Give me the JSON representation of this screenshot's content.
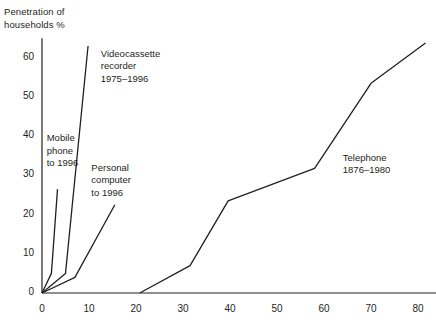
{
  "chart_data": {
    "type": "line",
    "title": "",
    "ylabel": "Penetration of\nhouseholds %",
    "xlabel": "",
    "xlim": [
      -1,
      84
    ],
    "ylim": [
      0,
      65
    ],
    "xticks": [
      0,
      10,
      20,
      30,
      40,
      50,
      60,
      70,
      80
    ],
    "xtick_labels": [
      "0",
      "10",
      "20",
      "30",
      "40",
      "50",
      "60",
      "70",
      "80"
    ],
    "yticks": [
      0,
      10,
      20,
      30,
      40,
      50,
      60
    ],
    "ytick_labels": [
      "0",
      "10",
      "20",
      "30",
      "40",
      "50",
      "60"
    ],
    "grid": false,
    "legend": "inline annotations",
    "series": [
      {
        "name": "Mobile phone to 1996",
        "label": "Mobile\nphone\nto 1996",
        "label_x": 1.0,
        "label_y": 39.5,
        "points": [
          [
            0,
            0
          ],
          [
            2.0,
            5.0
          ],
          [
            3.3,
            26.5
          ]
        ]
      },
      {
        "name": "Videocassette recorder 1975–1996",
        "label": "Videocassette\nrecorder\n1975–1996",
        "label_x": 12.5,
        "label_y": 61.0,
        "points": [
          [
            0,
            0
          ],
          [
            5.0,
            5.0
          ],
          [
            9.8,
            63.0
          ]
        ]
      },
      {
        "name": "Personal computer to 1996",
        "label": "Personal\ncomputer\nto 1996",
        "label_x": 10.5,
        "label_y": 32.0,
        "points": [
          [
            0,
            0
          ],
          [
            7.0,
            4.0
          ],
          [
            15.5,
            22.5
          ]
        ]
      },
      {
        "name": "Telephone 1876–1980",
        "label": "Telephone\n1876–1980",
        "label_x": 64.0,
        "label_y": 34.5,
        "points": [
          [
            20.8,
            0
          ],
          [
            31.5,
            7.0
          ],
          [
            39.6,
            23.5
          ],
          [
            58.0,
            31.8
          ],
          [
            70.0,
            53.5
          ],
          [
            81.6,
            63.8
          ]
        ]
      }
    ]
  },
  "style": {
    "line_color": "#231f20",
    "axis_color": "#231f20",
    "background": "#ffffff"
  }
}
